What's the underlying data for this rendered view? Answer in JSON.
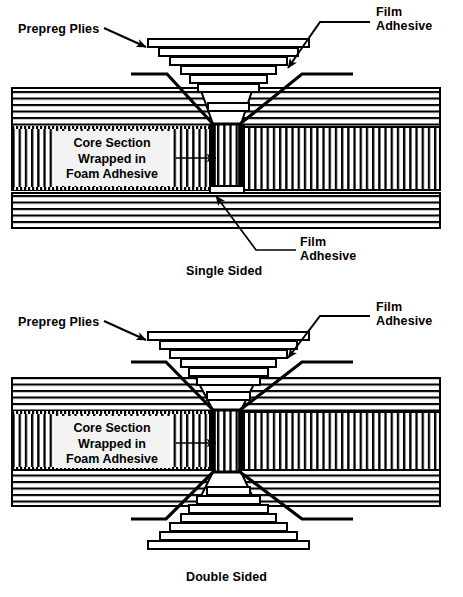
{
  "figure": {
    "title_visible": false,
    "background": "#ffffff",
    "ink": "#000000",
    "panels": [
      {
        "id": "single-sided",
        "caption": "Single Sided",
        "caption_pos": {
          "x": 186,
          "y": 264
        },
        "labels": [
          {
            "name": "prepreg-plies",
            "text": "Prepreg Plies",
            "x": 18,
            "y": 22
          },
          {
            "name": "film-adhesive-top",
            "text": "Film\nAdhesive",
            "x": 376,
            "y": 5
          },
          {
            "name": "film-adhesive-bottom",
            "text": "Film\nAdhesive",
            "x": 300,
            "y": 235
          },
          {
            "name": "core-section",
            "text": "Core Section\nWrapped in\nFoam Adhesive",
            "x": 72,
            "y": 136
          }
        ],
        "geometry": {
          "left": 12,
          "right": 440,
          "skin_top_y0": 88,
          "skin_top_y1": 127,
          "core_y0": 127,
          "core_y1": 190,
          "skin_bot_y0": 192,
          "skin_bot_y1": 228,
          "core_center_x0": 211,
          "core_center_x1": 243,
          "ply_count": 7,
          "ply_top_y": 40,
          "ply_widest": 160,
          "ply_narrowest": 30,
          "ply_height": 8
        }
      },
      {
        "id": "double-sided",
        "caption": "Double Sided",
        "caption_pos": {
          "x": 186,
          "y": 570
        },
        "labels": [
          {
            "name": "prepreg-plies",
            "text": "Prepreg Plies",
            "x": 18,
            "y": 315
          },
          {
            "name": "film-adhesive-top",
            "text": "Film\nAdhesive",
            "x": 376,
            "y": 300
          },
          {
            "name": "core-section",
            "text": "Core Section\nWrapped in\nFoam Adhesive",
            "x": 72,
            "y": 421
          }
        ],
        "geometry": {
          "left": 12,
          "right": 440,
          "skin_top_y0": 378,
          "skin_top_y1": 412,
          "core_y0": 412,
          "core_y1": 470,
          "skin_bot_y0": 470,
          "skin_bot_y1": 506,
          "core_center_x0": 211,
          "core_center_x1": 243,
          "ply_count_top": 7,
          "ply_count_bottom": 7
        }
      }
    ],
    "legend_terms": [
      "Prepreg Plies",
      "Film Adhesive",
      "Core Section Wrapped in Foam Adhesive",
      "Single Sided",
      "Double Sided"
    ]
  }
}
